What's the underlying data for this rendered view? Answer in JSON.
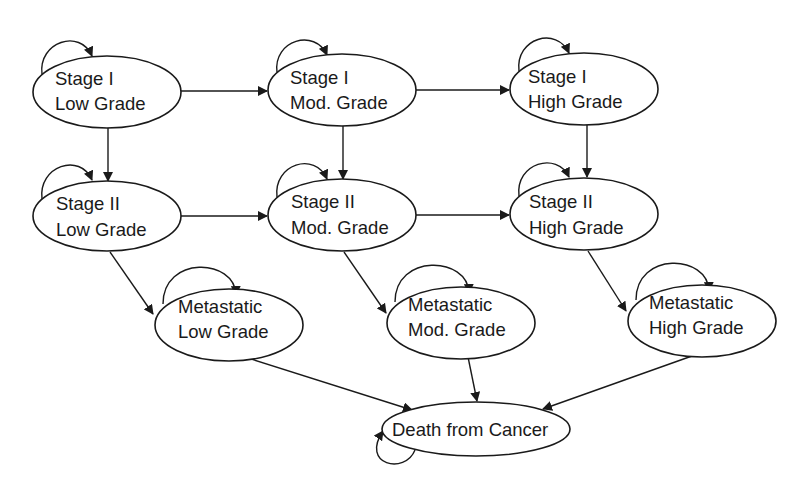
{
  "diagram": {
    "type": "state-transition",
    "nodes": [
      {
        "id": "s1l",
        "line1": "Stage I",
        "line2": "Low Grade"
      },
      {
        "id": "s1m",
        "line1": "Stage I",
        "line2": "Mod. Grade"
      },
      {
        "id": "s1h",
        "line1": "Stage I",
        "line2": "High Grade"
      },
      {
        "id": "s2l",
        "line1": "Stage II",
        "line2": "Low Grade"
      },
      {
        "id": "s2m",
        "line1": "Stage II",
        "line2": "Mod. Grade"
      },
      {
        "id": "s2h",
        "line1": "Stage II",
        "line2": "High Grade"
      },
      {
        "id": "ml",
        "line1": "Metastatic",
        "line2": "Low Grade"
      },
      {
        "id": "mm",
        "line1": "Metastatic",
        "line2": "Mod. Grade"
      },
      {
        "id": "mh",
        "line1": "Metastatic",
        "line2": "High Grade"
      },
      {
        "id": "d",
        "line1": "Death from Cancer"
      }
    ],
    "edges": [
      [
        "s1l",
        "s1m"
      ],
      [
        "s1m",
        "s1h"
      ],
      [
        "s2l",
        "s2m"
      ],
      [
        "s2m",
        "s2h"
      ],
      [
        "s1l",
        "s2l"
      ],
      [
        "s1m",
        "s2m"
      ],
      [
        "s1h",
        "s2h"
      ],
      [
        "s2l",
        "ml"
      ],
      [
        "s2m",
        "mm"
      ],
      [
        "s2h",
        "mh"
      ],
      [
        "ml",
        "d"
      ],
      [
        "mm",
        "d"
      ],
      [
        "mh",
        "d"
      ]
    ],
    "self_loops": [
      "s1l",
      "s1m",
      "s1h",
      "s2l",
      "s2m",
      "s2h",
      "ml",
      "mm",
      "mh",
      "d"
    ]
  }
}
